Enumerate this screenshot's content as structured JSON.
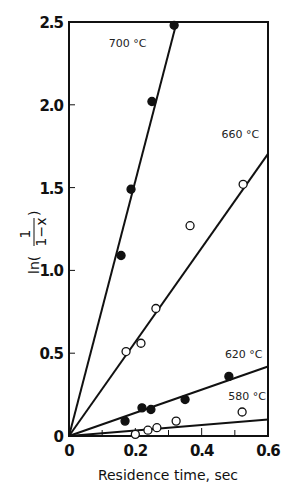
{
  "chart_data": {
    "type": "scatter",
    "title": "",
    "xlabel": "Residence time, sec",
    "ylabel": "ln(1/(1−x))",
    "xlim": [
      0,
      0.6
    ],
    "ylim": [
      0,
      2.5
    ],
    "xticks": [
      0,
      0.2,
      0.4,
      0.6
    ],
    "xtick_labels": [
      "0",
      "0.2",
      "0.4",
      "0.6"
    ],
    "xminor_ticks": [
      0.1,
      0.3,
      0.5
    ],
    "yticks": [
      0,
      0.5,
      1.0,
      1.5,
      2.0,
      2.5
    ],
    "ytick_labels": [
      "0",
      "0.5",
      "1.0",
      "1.5",
      "2.0",
      "2.5"
    ],
    "grid": false,
    "legend": "inline labels next to fitted lines",
    "series": [
      {
        "name": "700 °C",
        "label": "700",
        "marker": "filled-circle",
        "fit_slope": 7.7,
        "points": [
          [
            0.157,
            1.09
          ],
          [
            0.187,
            1.49
          ],
          [
            0.25,
            2.02
          ],
          [
            0.317,
            2.48
          ]
        ]
      },
      {
        "name": "660 °C",
        "label": "660",
        "marker": "open-circle",
        "fit_slope": 2.84,
        "points": [
          [
            0.172,
            0.51
          ],
          [
            0.217,
            0.56
          ],
          [
            0.262,
            0.77
          ],
          [
            0.365,
            1.27
          ],
          [
            0.525,
            1.52
          ]
        ]
      },
      {
        "name": "620 °C",
        "label": "620",
        "marker": "filled-circle",
        "fit_slope": 0.7,
        "points": [
          [
            0.169,
            0.09
          ],
          [
            0.22,
            0.17
          ],
          [
            0.247,
            0.16
          ],
          [
            0.35,
            0.22
          ],
          [
            0.482,
            0.36
          ]
        ]
      },
      {
        "name": "580 °C",
        "label": "580",
        "marker": "open-circle",
        "fit_slope": 0.165,
        "points": [
          [
            0.2,
            0.01
          ],
          [
            0.238,
            0.035
          ],
          [
            0.265,
            0.05
          ],
          [
            0.323,
            0.09
          ],
          [
            0.522,
            0.145
          ]
        ]
      }
    ],
    "annotations": [
      {
        "text": "700 °C",
        "x": 0.12,
        "y": 2.35
      },
      {
        "text": "660 °C",
        "x": 0.46,
        "y": 1.8
      },
      {
        "text": "620 °C",
        "x": 0.47,
        "y": 0.47
      },
      {
        "text": "580 °C",
        "x": 0.48,
        "y": 0.22
      }
    ],
    "unit_label": "°C"
  }
}
